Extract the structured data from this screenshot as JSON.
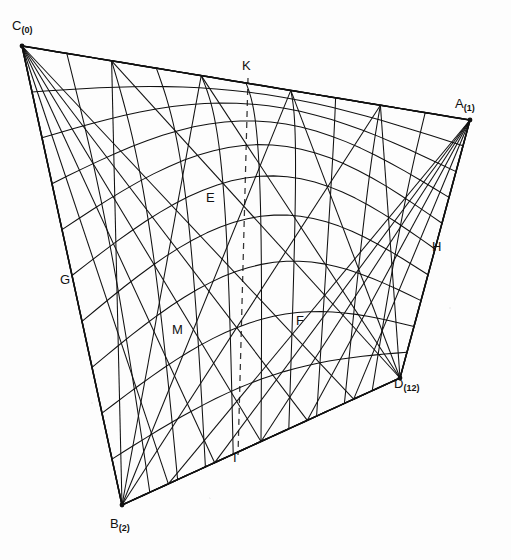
{
  "figure": {
    "type": "geometric-surface-diagram",
    "background_color": "#fdfdfd",
    "line_color": "#111111",
    "dashed_color": "#333333",
    "vertices": [
      {
        "id": "C",
        "label": "C",
        "sub": "(0)",
        "x": 22,
        "y": 46,
        "label_x": 12,
        "label_y": 30,
        "role": "surface-corner-high-left"
      },
      {
        "id": "A",
        "label": "A",
        "sub": "(1)",
        "x": 470,
        "y": 120,
        "label_x": 455,
        "label_y": 108,
        "role": "surface-corner-high-right"
      },
      {
        "id": "B",
        "label": "B",
        "sub": "(2)",
        "x": 122,
        "y": 505,
        "label_x": 110,
        "label_y": 528,
        "role": "surface-corner-low-left"
      },
      {
        "id": "D",
        "label": "D",
        "sub": "(12)",
        "x": 400,
        "y": 378,
        "label_x": 394,
        "label_y": 388,
        "role": "surface-corner-low-right"
      }
    ],
    "point_labels": [
      {
        "id": "E",
        "label": "E",
        "x": 206,
        "y": 202,
        "mark_x": 218,
        "mark_y": 215
      },
      {
        "id": "G",
        "label": "G",
        "x": 60,
        "y": 284,
        "mark_x": 76,
        "mark_y": 279
      },
      {
        "id": "M",
        "label": "M",
        "x": 172,
        "y": 334,
        "mark_x": 186,
        "mark_y": 330
      },
      {
        "id": "F",
        "label": "F",
        "x": 296,
        "y": 325,
        "mark_x": 292,
        "mark_y": 318
      },
      {
        "id": "H",
        "label": "H",
        "x": 432,
        "y": 251,
        "mark_x": 428,
        "mark_y": 247
      },
      {
        "id": "K",
        "label": "K",
        "x": 242,
        "y": 70,
        "mark_x": 248,
        "mark_y": 78
      },
      {
        "id": "I",
        "label": "I",
        "x": 233,
        "y": 462,
        "mark_x": 238,
        "mark_y": 455
      }
    ],
    "dashed_edges": [
      {
        "from": "C",
        "to": "A",
        "name": "top-back-edge"
      },
      {
        "from": "B",
        "to": "D",
        "name": "bottom-back-edge"
      },
      {
        "from": "K",
        "to": "I",
        "name": "vertical-axis"
      }
    ],
    "mesh": {
      "u_lines": 10,
      "v_lines": 10,
      "description": "Ruled generator lines of a hyperbolic paraboloid spanning quadrilateral C-A-D-B"
    }
  }
}
